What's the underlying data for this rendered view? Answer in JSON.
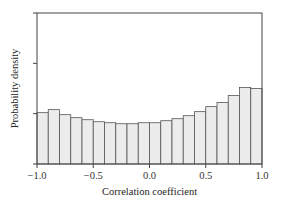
{
  "chart_data": {
    "type": "bar",
    "subtype": "histogram",
    "title": "",
    "xlabel": "Correlation coefficient",
    "ylabel": "Probability density",
    "xlim": [
      -1.0,
      1.0
    ],
    "ylim": [
      0,
      1.5
    ],
    "x_ticks": [
      -1.0,
      -0.5,
      0.0,
      0.5,
      1.0
    ],
    "x_tick_labels": [
      "−1.0",
      "−0.5",
      "0.0",
      "0.5",
      "1.0"
    ],
    "y_ticks": [
      0,
      0.5,
      1.0,
      1.5
    ],
    "y_tick_labels": [],
    "grid": false,
    "legend": null,
    "bin_edges": [
      -1.0,
      -0.9,
      -0.8,
      -0.7,
      -0.6,
      -0.5,
      -0.4,
      -0.3,
      -0.2,
      -0.1,
      0.0,
      0.1,
      0.2,
      0.3,
      0.4,
      0.5,
      0.6,
      0.7,
      0.8,
      0.9,
      1.0
    ],
    "values": [
      0.51,
      0.54,
      0.49,
      0.46,
      0.44,
      0.42,
      0.41,
      0.4,
      0.4,
      0.41,
      0.41,
      0.43,
      0.45,
      0.48,
      0.52,
      0.57,
      0.61,
      0.68,
      0.76,
      0.75
    ],
    "colors": {
      "bar_fill": "#ececec",
      "bar_edge": "#555555",
      "axis": "#444444"
    }
  }
}
